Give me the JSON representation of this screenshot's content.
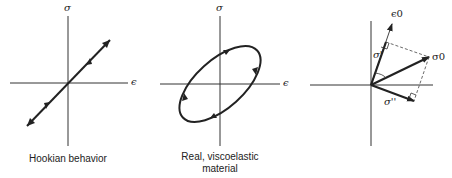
{
  "panels": [
    {
      "id": "hookian",
      "caption": "Hookian behavior",
      "y_axis_label": "σ",
      "x_axis_label": "ϵ"
    },
    {
      "id": "viscoelastic",
      "caption_line1": "Real, viscoelastic",
      "caption_line2": "material",
      "y_axis_label": "σ",
      "x_axis_label": "ϵ"
    },
    {
      "id": "vector",
      "epsilon_label": "ϵ0",
      "sigma0_label": "σ0",
      "sigma_prime_label": "σ'",
      "sigma_double_prime_label": "σ''"
    }
  ],
  "colors": {
    "ink": "#222222",
    "background": "#ffffff"
  }
}
